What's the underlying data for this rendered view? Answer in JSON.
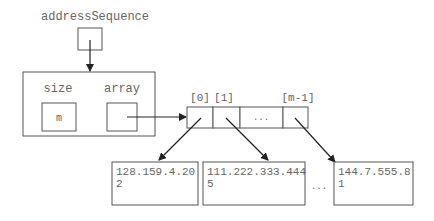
{
  "diagram": {
    "variable_label": "addressSequence",
    "object": {
      "fields": [
        {
          "name": "size",
          "value": "m"
        },
        {
          "name": "array",
          "value": ""
        }
      ]
    },
    "array": {
      "index_labels": [
        "[0]",
        "[1]",
        "[m-1]"
      ],
      "ellipsis": "...",
      "cells": [
        "",
        "",
        "...",
        ""
      ]
    },
    "elements": [
      {
        "line1": "128.159.4.20",
        "line2": "2"
      },
      {
        "line1": "111.222.333.444",
        "line2": "5"
      },
      {
        "line1": "144.7.555.8",
        "line2": "1"
      }
    ],
    "elements_ellipsis": "...",
    "colors": {
      "stroke": "#555555",
      "arrow": "#222222",
      "text": "#666666"
    }
  }
}
